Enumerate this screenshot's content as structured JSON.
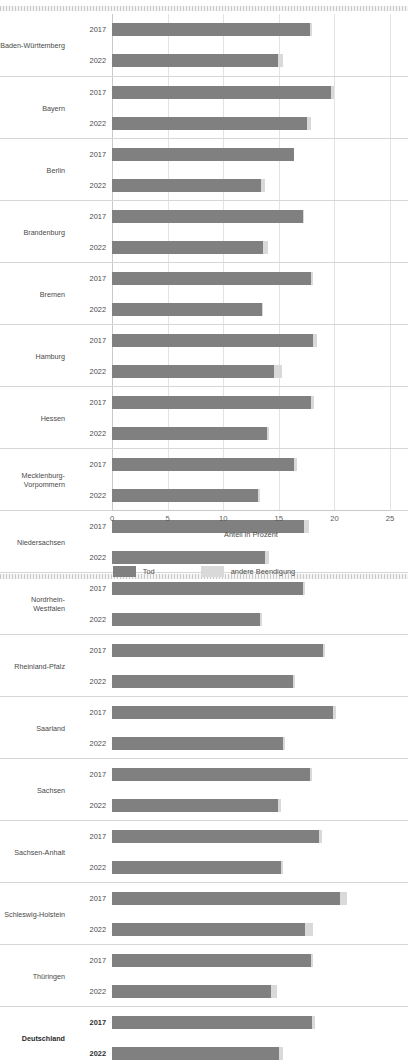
{
  "chart_data": {
    "type": "bar",
    "orientation": "horizontal",
    "stacked": true,
    "title": "",
    "xlabel": "Anteil in Prozent",
    "ylabel": "",
    "xlim": [
      0,
      25
    ],
    "xticks": [
      0,
      5,
      10,
      15,
      20,
      25
    ],
    "grid": true,
    "legend_position": "bottom",
    "series": [
      {
        "name": "Tod",
        "color": "#808080"
      },
      {
        "name": "andere Beendigung",
        "color": "#d9d9d9"
      }
    ],
    "categories": [
      "Baden-Württemberg",
      "Bayern",
      "Berlin",
      "Brandenburg",
      "Bremen",
      "Hamburg",
      "Hessen",
      "Mecklenburg-Vorpommern",
      "Niedersachsen",
      "Nordrhein-Westfalen",
      "Rheinland-Pfalz",
      "Saarland",
      "Sachsen",
      "Sachsen-Anhalt",
      "Schleswig-Holstein",
      "Thüringen",
      "Deutschland"
    ],
    "subcategories": [
      "2017",
      "2022"
    ],
    "rows": [
      {
        "category": "Baden-Württemberg",
        "bold": false,
        "bars": [
          {
            "year": "2017",
            "tod": 17.8,
            "andere": 0.2
          },
          {
            "year": "2022",
            "tod": 14.9,
            "andere": 0.5
          }
        ]
      },
      {
        "category": "Bayern",
        "bold": false,
        "bars": [
          {
            "year": "2017",
            "tod": 19.7,
            "andere": 0.3
          },
          {
            "year": "2022",
            "tod": 17.5,
            "andere": 0.4
          }
        ]
      },
      {
        "category": "Berlin",
        "bold": false,
        "bars": [
          {
            "year": "2017",
            "tod": 16.4,
            "andere": 0.0
          },
          {
            "year": "2022",
            "tod": 13.4,
            "andere": 0.4
          }
        ]
      },
      {
        "category": "Brandenburg",
        "bold": false,
        "bars": [
          {
            "year": "2017",
            "tod": 17.2,
            "andere": 0.1
          },
          {
            "year": "2022",
            "tod": 13.6,
            "andere": 0.4
          }
        ]
      },
      {
        "category": "Bremen",
        "bold": false,
        "bars": [
          {
            "year": "2017",
            "tod": 17.9,
            "andere": 0.2
          },
          {
            "year": "2022",
            "tod": 13.5,
            "andere": 0.1
          }
        ]
      },
      {
        "category": "Hamburg",
        "bold": false,
        "bars": [
          {
            "year": "2017",
            "tod": 18.1,
            "andere": 0.3
          },
          {
            "year": "2022",
            "tod": 14.6,
            "andere": 0.7
          }
        ]
      },
      {
        "category": "Hessen",
        "bold": false,
        "bars": [
          {
            "year": "2017",
            "tod": 17.9,
            "andere": 0.3
          },
          {
            "year": "2022",
            "tod": 13.9,
            "andere": 0.2
          }
        ]
      },
      {
        "category": "Mecklenburg-Vorpommern",
        "bold": false,
        "bars": [
          {
            "year": "2017",
            "tod": 16.4,
            "andere": 0.2
          },
          {
            "year": "2022",
            "tod": 13.1,
            "andere": 0.2
          }
        ]
      },
      {
        "category": "Niedersachsen",
        "bold": false,
        "bars": [
          {
            "year": "2017",
            "tod": 17.3,
            "andere": 0.4
          },
          {
            "year": "2022",
            "tod": 13.8,
            "andere": 0.3
          }
        ]
      },
      {
        "category": "Nordrhein-Westfalen",
        "bold": false,
        "bars": [
          {
            "year": "2017",
            "tod": 17.2,
            "andere": 0.2
          },
          {
            "year": "2022",
            "tod": 13.3,
            "andere": 0.2
          }
        ]
      },
      {
        "category": "Rheinland-Pfalz",
        "bold": false,
        "bars": [
          {
            "year": "2017",
            "tod": 19.0,
            "andere": 0.2
          },
          {
            "year": "2022",
            "tod": 16.3,
            "andere": 0.2
          }
        ]
      },
      {
        "category": "Saarland",
        "bold": false,
        "bars": [
          {
            "year": "2017",
            "tod": 19.9,
            "andere": 0.2
          },
          {
            "year": "2022",
            "tod": 15.4,
            "andere": 0.2
          }
        ]
      },
      {
        "category": "Sachsen",
        "bold": false,
        "bars": [
          {
            "year": "2017",
            "tod": 17.8,
            "andere": 0.2
          },
          {
            "year": "2022",
            "tod": 14.9,
            "andere": 0.3
          }
        ]
      },
      {
        "category": "Sachsen-Anhalt",
        "bold": false,
        "bars": [
          {
            "year": "2017",
            "tod": 18.6,
            "andere": 0.3
          },
          {
            "year": "2022",
            "tod": 15.2,
            "andere": 0.2
          }
        ]
      },
      {
        "category": "Schleswig-Holstein",
        "bold": false,
        "bars": [
          {
            "year": "2017",
            "tod": 20.5,
            "andere": 0.6
          },
          {
            "year": "2022",
            "tod": 17.4,
            "andere": 0.7
          }
        ]
      },
      {
        "category": "Thüringen",
        "bold": false,
        "bars": [
          {
            "year": "2017",
            "tod": 17.9,
            "andere": 0.2
          },
          {
            "year": "2022",
            "tod": 14.3,
            "andere": 0.5
          }
        ]
      },
      {
        "category": "Deutschland",
        "bold": true,
        "bars": [
          {
            "year": "2017",
            "tod": 18.0,
            "andere": 0.3
          },
          {
            "year": "2022",
            "tod": 15.0,
            "andere": 0.4
          }
        ]
      }
    ]
  }
}
